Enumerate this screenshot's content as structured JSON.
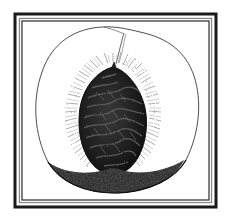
{
  "illustration": {
    "subject": "peach cross-section with pit",
    "style": "black-and-white engraving",
    "frame": {
      "outer_color": "#1a1a1a",
      "inner_gap_color": "#ffffff",
      "mid_line_color": "#8a8a8a",
      "inner_line_color": "#2a2a2a"
    },
    "colors": {
      "background": "#ffffff",
      "outline": "#3a3a3a",
      "pit_dark": "#1c1c1c",
      "pit_ridge": "#4a4a4a",
      "fuzz": "#7a7a7a",
      "base_stipple": "#2b2b2b"
    }
  }
}
